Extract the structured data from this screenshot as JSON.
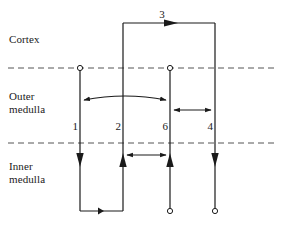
{
  "figure": {
    "type": "schematic-diagram",
    "width": 282,
    "height": 227,
    "background_color": "#ffffff",
    "line_color": "#1a1a1a",
    "dashed_boundary_color": "#555555"
  },
  "zones": [
    {
      "id": "cortex",
      "label": "Cortex",
      "label_x": 9,
      "label_y": 33
    },
    {
      "id": "outer-medulla",
      "label": "Outer\nmedulla",
      "label_x": 9,
      "label_y": 90
    },
    {
      "id": "inner-medulla",
      "label": "Inner\nmedulla",
      "label_x": 9,
      "label_y": 160
    }
  ],
  "boundaries": [
    {
      "id": "cortex-outer-medulla-boundary",
      "y": 68,
      "x1": 8,
      "x2": 275,
      "style": "dashed"
    },
    {
      "id": "outer-inner-medulla-boundary",
      "y": 143,
      "x1": 8,
      "x2": 275,
      "style": "dashed"
    }
  ],
  "limbs": [
    {
      "id": "limb-1",
      "label": "1",
      "x": 80,
      "label_x": 64,
      "label_y": 126,
      "top_y": 68,
      "bottom_y": 211,
      "top_marker": "open-circle",
      "arrow_direction": "down",
      "arrow_y": 165
    },
    {
      "id": "limb-2",
      "label": "2",
      "x": 123,
      "label_x": 107,
      "label_y": 126,
      "top_y": 23,
      "bottom_y": 211,
      "top_marker": "none",
      "arrow_direction": "up",
      "arrow_y": 165
    },
    {
      "id": "limb-6",
      "label": "6",
      "x": 170,
      "label_x": 154,
      "label_y": 126,
      "top_y": 68,
      "bottom_y": 211,
      "top_marker": "open-circle",
      "arrow_direction": "up",
      "arrow_y": 165
    },
    {
      "id": "limb-4",
      "label": "4",
      "x": 215,
      "label_x": 199,
      "label_y": 126,
      "top_y": 23,
      "bottom_y": 211,
      "top_marker": "none",
      "arrow_direction": "down",
      "arrow_y": 165
    }
  ],
  "bottom_markers": [
    {
      "id": "limb-6-bottom-circle",
      "x": 170,
      "y": 211,
      "marker": "open-circle"
    },
    {
      "id": "limb-4-bottom-circle",
      "x": 215,
      "y": 211,
      "marker": "open-circle"
    }
  ],
  "connectors": [
    {
      "id": "cortex-connector-3",
      "label": "3",
      "label_x": 160,
      "label_y": 9,
      "y": 23,
      "x1": 123,
      "x2": 215,
      "arrow": "right",
      "arrow_x": 170
    },
    {
      "id": "inner-medulla-bottom-connector",
      "label": "",
      "y": 211,
      "x1": 80,
      "x2": 123,
      "arrow": "left",
      "arrow_x": 102
    }
  ],
  "exchange_arrows": [
    {
      "id": "exchange-1-to-6",
      "zone": "outer-medulla",
      "x1": 80,
      "x2": 170,
      "y": 98,
      "curve": 6,
      "heads": "both"
    },
    {
      "id": "exchange-6-to-4",
      "zone": "outer-medulla",
      "x1": 170,
      "x2": 215,
      "y": 110,
      "curve": 0,
      "heads": "both"
    },
    {
      "id": "exchange-2-to-6",
      "zone": "inner-medulla",
      "x1": 123,
      "x2": 170,
      "y": 155,
      "curve": 0,
      "heads": "both"
    }
  ]
}
